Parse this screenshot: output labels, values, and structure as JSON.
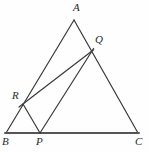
{
  "figure": {
    "background_color": "#fefefe",
    "stroke_color": "#3a3a3a",
    "baseline_color": "#555555",
    "label_color": "#2a2a2a",
    "width": 148,
    "height": 153
  },
  "points": {
    "A": {
      "label": "A",
      "x": 74,
      "y": 20,
      "label_x": 73,
      "label_y": 2
    },
    "B": {
      "label": "B",
      "x": 6,
      "y": 133,
      "label_x": 2,
      "label_y": 136
    },
    "C": {
      "label": "C",
      "x": 138,
      "y": 133,
      "label_x": 135,
      "label_y": 136
    },
    "P": {
      "label": "P",
      "x": 40,
      "y": 133,
      "label_x": 36,
      "label_y": 136
    },
    "Q": {
      "label": "Q",
      "x": 92,
      "y": 51,
      "label_x": 95,
      "label_y": 34
    },
    "R": {
      "label": "R",
      "x": 23,
      "y": 104,
      "label_x": 12,
      "label_y": 90
    }
  },
  "segments": [
    {
      "name": "side-AB",
      "from": "A",
      "to": "B",
      "width": 1.2,
      "style": "solid"
    },
    {
      "name": "side-AC",
      "from": "A",
      "to": "C",
      "width": 1.2,
      "style": "solid"
    },
    {
      "name": "side-BC",
      "from": "B",
      "to": "C",
      "width": 1.8,
      "style": "solid"
    },
    {
      "name": "segment-PQ",
      "from": "P",
      "to": "Q",
      "width": 1.2,
      "style": "solid"
    },
    {
      "name": "segment-RQ",
      "from": "R",
      "to": "Q",
      "width": 1.2,
      "style": "solid"
    },
    {
      "name": "segment-RP",
      "from": "R",
      "to": "P",
      "width": 1.2,
      "style": "solid"
    }
  ],
  "labels_order": [
    "A",
    "Q",
    "R",
    "B",
    "P",
    "C"
  ]
}
